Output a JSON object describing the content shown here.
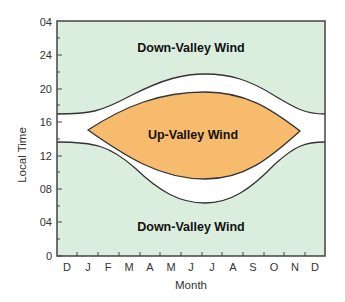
{
  "diagram": {
    "title": "",
    "x_axis": {
      "label": "Month",
      "ticks": [
        "D",
        "J",
        "F",
        "M",
        "A",
        "M",
        "J",
        "J",
        "A",
        "S",
        "O",
        "N",
        "D"
      ]
    },
    "y_axis": {
      "label": "Local Time",
      "ticks": [
        "0",
        "04",
        "08",
        "12",
        "16",
        "20",
        "24",
        "04"
      ]
    },
    "regions": {
      "upper": "Down-Valley Wind",
      "middle": "Up-Valley Wind",
      "lower": "Down-Valley Wind"
    },
    "colors": {
      "background": "#dbeedd",
      "transition": "#ffffff",
      "up_valley": "#f7bb6e",
      "outline": "#333333",
      "axis": "#444444"
    }
  }
}
